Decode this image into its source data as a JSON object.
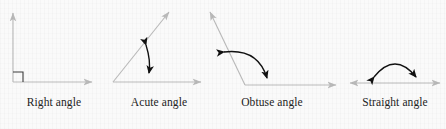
{
  "figure": {
    "background_color": "#fafafa",
    "ray_color": "#b9b9b9",
    "arc_color": "#111111",
    "label_color": "#232323",
    "panels": [
      {
        "id": "right-angle",
        "label": "Right angle",
        "angle_degrees": 90,
        "marker": "square",
        "marker_name": "right-angle-square-marker",
        "rays": [
          {
            "name": "horizontal-ray",
            "direction": "east"
          },
          {
            "name": "vertical-ray",
            "direction": "north"
          }
        ],
        "arc": null
      },
      {
        "id": "acute-angle",
        "label": "Acute angle",
        "angle_degrees": 55,
        "marker": "arc",
        "marker_name": "acute-angle-arc",
        "rays": [
          {
            "name": "horizontal-ray",
            "direction": "east"
          },
          {
            "name": "oblique-ray",
            "direction": "northeast"
          }
        ],
        "arc": {
          "double_headed": true
        }
      },
      {
        "id": "obtuse-angle",
        "label": "Obtuse angle",
        "angle_degrees": 125,
        "marker": "arc",
        "marker_name": "obtuse-angle-arc",
        "rays": [
          {
            "name": "horizontal-ray",
            "direction": "east"
          },
          {
            "name": "oblique-ray",
            "direction": "northwest"
          }
        ],
        "arc": {
          "double_headed": true
        }
      },
      {
        "id": "straight-angle",
        "label": "Straight angle",
        "angle_degrees": 180,
        "marker": "arc",
        "marker_name": "straight-angle-arc",
        "rays": [
          {
            "name": "right-ray",
            "direction": "east"
          },
          {
            "name": "left-ray",
            "direction": "west"
          }
        ],
        "arc": {
          "double_headed": true
        }
      }
    ]
  }
}
